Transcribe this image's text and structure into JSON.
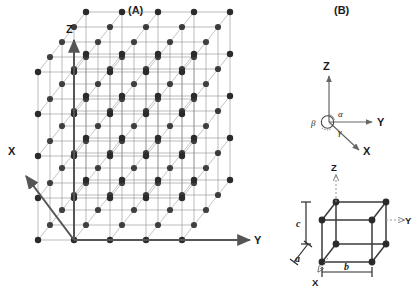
{
  "figure": {
    "panels": [
      {
        "id": "A",
        "label": "(A)",
        "description": "space-lattice",
        "axes": [
          {
            "name": "Z",
            "label": "Z",
            "direction": "up",
            "style": "solid"
          },
          {
            "name": "Y",
            "label": "Y",
            "direction": "right",
            "style": "solid"
          },
          {
            "name": "X",
            "label": "X",
            "direction": "down-left",
            "style": "solid"
          }
        ],
        "lattice": {
          "type": "primitive-cubic-array",
          "nodes_per_edge": 5,
          "cells_per_edge": 4,
          "total_nodes": 125,
          "node_color": "#2b2b2b",
          "edge_color": "#8c8c8c"
        }
      },
      {
        "id": "B",
        "label": "(B)",
        "description": "unit-cell-and-axes",
        "axes_top": [
          {
            "name": "Z",
            "label": "Z",
            "direction": "up",
            "style": "solid"
          },
          {
            "name": "Y",
            "label": "Y",
            "direction": "right",
            "style": "solid"
          },
          {
            "name": "X",
            "label": "X",
            "direction": "down-right",
            "style": "solid"
          }
        ],
        "angles": [
          {
            "name": "alpha",
            "label": "α",
            "between": "Y-Z"
          },
          {
            "name": "beta",
            "label": "β",
            "between": "X-Z"
          },
          {
            "name": "gamma",
            "label": "γ",
            "between": "X-Y"
          }
        ],
        "axes_cell": [
          {
            "name": "Z",
            "label": "Z",
            "direction": "up",
            "style": "dotted"
          },
          {
            "name": "Y",
            "label": "Y",
            "direction": "right",
            "style": "dotted"
          },
          {
            "name": "X",
            "label": "X",
            "direction": "down-left",
            "style": "dotted"
          }
        ],
        "cell": {
          "type": "parallelepiped-unit-cell",
          "vertices": 8,
          "node_color": "#2b2b2b",
          "edge_color": "#3a3a3a"
        },
        "parameters": [
          {
            "name": "a",
            "label": "a",
            "axis": "X",
            "orientation": "diagonal-lower-left"
          },
          {
            "name": "b",
            "label": "b",
            "axis": "Y",
            "orientation": "horizontal-bottom"
          },
          {
            "name": "c",
            "label": "c",
            "axis": "Z",
            "orientation": "vertical-left"
          }
        ]
      }
    ],
    "colors": {
      "background": "#ffffff",
      "node": "#2b2b2b",
      "lattice_edge": "#8c8c8c",
      "axis": "#555555",
      "text": "#1a1a1a"
    }
  }
}
